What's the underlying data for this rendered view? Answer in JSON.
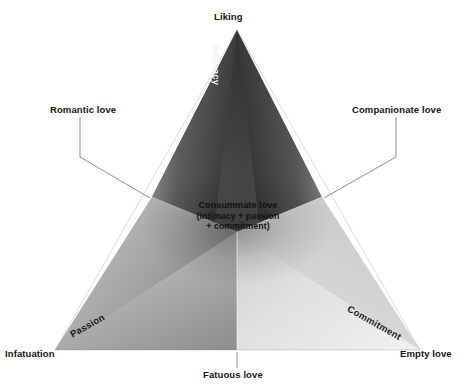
{
  "diagram": {
    "background_color": "#ffffff",
    "corners": {
      "top": "Liking",
      "bottom_left": "Infatuation",
      "bottom_right": "Empty love"
    },
    "edges": {
      "left": "Romantic love",
      "right": "Companionate love",
      "bottom": "Fatuous love"
    },
    "components": {
      "top": "Intimacy",
      "bottom_left": "Passion",
      "bottom_right": "Commitment"
    },
    "center": {
      "title": "Consummate love",
      "line1": "(intimacy + passion",
      "line2": "+ commitment)"
    },
    "colors": {
      "intimacy_dark": "#3a3a3a",
      "intimacy_light": "#8a8a8a",
      "passion_dark": "#6e6e6e",
      "passion_light": "#cfcfcf",
      "commitment_dark": "#9a9a9a",
      "commitment_light": "#e9e9e9",
      "leader_line": "#7a7a7a",
      "text": "#151515",
      "text_on_dark": "#f2f2f2"
    }
  }
}
